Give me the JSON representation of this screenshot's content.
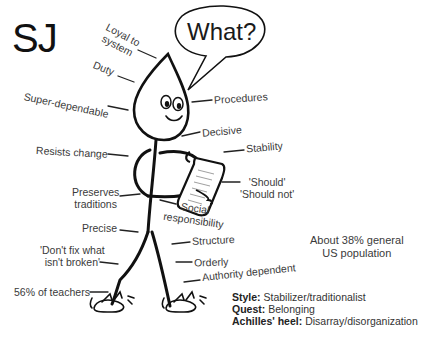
{
  "title": "SJ",
  "speech_bubble": "What?",
  "labels_left": {
    "loyal_to_system": "Loyal to\nsystem",
    "duty": "Duty",
    "super_dependable": "Super-dependable",
    "resists_change": "Resists change",
    "preserves_traditions_1": "Preserves",
    "preserves_traditions_2": "traditions",
    "precise": "Precise",
    "dont_fix_1": "'Don't fix what",
    "dont_fix_2": "isn't broken'",
    "teachers": "56% of teachers"
  },
  "labels_right": {
    "procedures": "Procedures",
    "decisive": "Decisive",
    "stability": "Stability",
    "should": "'Should'",
    "should_not": "'Should not'",
    "social_1": "Social",
    "social_2": "responsibility",
    "structure": "Structure",
    "orderly": "Orderly",
    "authority_dependent": "Authority dependent"
  },
  "population": {
    "line1": "About 38% general",
    "line2": "US population"
  },
  "summary": {
    "style_label": "Style:",
    "style_value": "Stabilizer/traditionalist",
    "quest_label": "Quest:",
    "quest_value": "Belonging",
    "heel_label": "Achilles' heel:",
    "heel_value": "Disarray/disorganization"
  }
}
